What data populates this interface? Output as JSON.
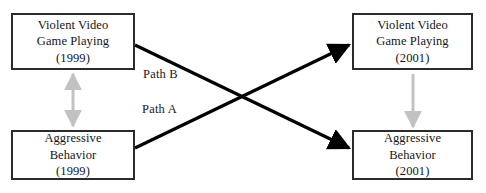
{
  "diagram": {
    "type": "cross-lagged-panel",
    "background_color": "#ffffff",
    "box_border_color": "#2b2b2b",
    "cross_path_color": "#000000",
    "vertical_path_color": "#bdbdbd",
    "nodes": [
      {
        "id": "vvgp-1999",
        "name": "violent-video-game-playing-1999",
        "line1": "Violent Video",
        "line2": "Game Playing",
        "line3": "(1999)"
      },
      {
        "id": "vvgp-2001",
        "name": "violent-video-game-playing-2001",
        "line1": "Violent Video",
        "line2": "Game Playing",
        "line3": "(2001)"
      },
      {
        "id": "ab-1999",
        "name": "aggressive-behavior-1999",
        "line1": "Aggressive",
        "line2": "Behavior",
        "line3": "(1999)"
      },
      {
        "id": "ab-2001",
        "name": "aggressive-behavior-2001",
        "line1": "Aggressive",
        "line2": "Behavior",
        "line3": "(2001)"
      }
    ],
    "paths": [
      {
        "id": "path-b",
        "label": "Path B",
        "from": "vvgp-1999",
        "to": "ab-2001",
        "style": "solid-black-arrow"
      },
      {
        "id": "path-a",
        "label": "Path A",
        "from": "ab-1999",
        "to": "vvgp-2001",
        "style": "solid-black-arrow"
      },
      {
        "id": "vertical-left",
        "label": "",
        "from": "ab-1999",
        "to": "vvgp-1999",
        "style": "gray-double-arrow"
      },
      {
        "id": "vertical-right",
        "label": "",
        "from": "vvgp-2001",
        "to": "ab-2001",
        "style": "gray-single-arrow-down"
      }
    ]
  }
}
